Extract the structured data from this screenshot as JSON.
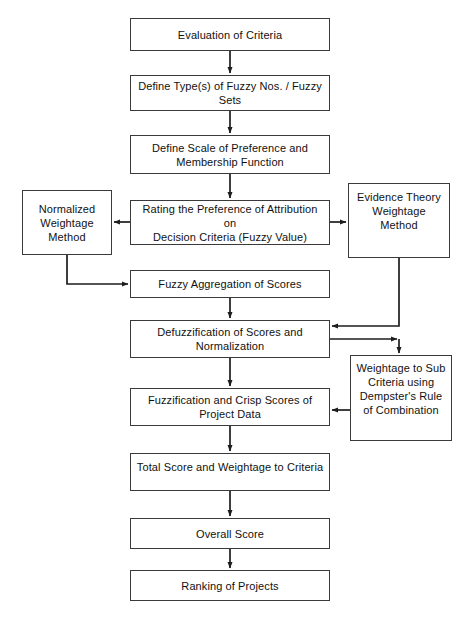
{
  "diagram": {
    "caption": "",
    "stroke_color": "#3a3a3a",
    "fill_color": "#ffffff",
    "text_color": "#111111",
    "nodes": [
      {
        "id": "evaluation-of-criteria",
        "label": "Evaluation of Criteria",
        "x": 130,
        "y": 18,
        "w": 200,
        "h": 33
      },
      {
        "id": "define-fuzzy-types",
        "label": "Define Type(s) of Fuzzy Nos. / Fuzzy\nSets",
        "x": 130,
        "y": 75,
        "w": 200,
        "h": 36
      },
      {
        "id": "define-scale-of-preference",
        "label": "Define Scale of Preference and\nMembership Function",
        "x": 130,
        "y": 135,
        "w": 200,
        "h": 39
      },
      {
        "id": "rating-the-preference",
        "label": "Rating the Preference of Attribution on\nDecision Criteria (Fuzzy Value)",
        "x": 130,
        "y": 200,
        "w": 200,
        "h": 45
      },
      {
        "id": "normalized-weightage-method",
        "label": "Normalized\nWeightage\nMethod",
        "x": 22,
        "y": 190,
        "w": 90,
        "h": 65
      },
      {
        "id": "evidence-theory-weightage-method",
        "label": "Evidence Theory\nWeightage\nMethod",
        "x": 348,
        "y": 183,
        "w": 102,
        "h": 75
      },
      {
        "id": "fuzzy-aggregation-of-scores",
        "label": "Fuzzy Aggregation of Scores",
        "x": 130,
        "y": 270,
        "w": 200,
        "h": 28
      },
      {
        "id": "defuzzification-of-scores",
        "label": "Defuzzification of Scores and\nNormalization",
        "x": 130,
        "y": 320,
        "w": 200,
        "h": 38
      },
      {
        "id": "weightage-to-sub-criteria",
        "label": "Weightage to Sub\nCriteria using\nDempster's Rule\nof Combination",
        "x": 350,
        "y": 355,
        "w": 102,
        "h": 86
      },
      {
        "id": "fuzzification-and-crisp-scores",
        "label": "Fuzzification and Crisp Scores of\nProject Data",
        "x": 130,
        "y": 388,
        "w": 200,
        "h": 38
      },
      {
        "id": "total-score-and-weightage",
        "label": "Total Score and Weightage to Criteria",
        "x": 130,
        "y": 453,
        "w": 200,
        "h": 38
      },
      {
        "id": "overall-score",
        "label": "Overall Score",
        "x": 130,
        "y": 518,
        "w": 200,
        "h": 31
      },
      {
        "id": "ranking-of-projects",
        "label": "Ranking of Projects",
        "x": 130,
        "y": 570,
        "w": 200,
        "h": 31
      }
    ],
    "connectors": [
      {
        "id": "evaluation-to-define-types",
        "kind": "arrow-down"
      },
      {
        "id": "define-types-to-define-scale",
        "kind": "arrow-down"
      },
      {
        "id": "define-scale-to-rating",
        "kind": "arrow-down"
      },
      {
        "id": "rating-to-normalized",
        "kind": "arrow-left"
      },
      {
        "id": "rating-to-evidence-theory",
        "kind": "arrow-right"
      },
      {
        "id": "normalized-to-fuzzy-aggregation",
        "kind": "elbow-down-right-arrow"
      },
      {
        "id": "fuzzy-aggregation-to-defuzzification",
        "kind": "arrow-down"
      },
      {
        "id": "evidence-theory-to-defuzzification",
        "kind": "elbow-down-left-arrow"
      },
      {
        "id": "defuzzification-to-evidence-trunk",
        "kind": "elbow-right-arrow"
      },
      {
        "id": "evidence-trunk-to-weightage-sub",
        "kind": "arrow-down"
      },
      {
        "id": "defuzzification-to-fuzzification",
        "kind": "arrow-down"
      },
      {
        "id": "weightage-sub-to-fuzzification",
        "kind": "arrow-left"
      },
      {
        "id": "fuzzification-to-total-score",
        "kind": "arrow-down"
      },
      {
        "id": "total-score-to-overall-score",
        "kind": "arrow-down"
      },
      {
        "id": "overall-score-to-ranking",
        "kind": "arrow-down"
      }
    ]
  }
}
